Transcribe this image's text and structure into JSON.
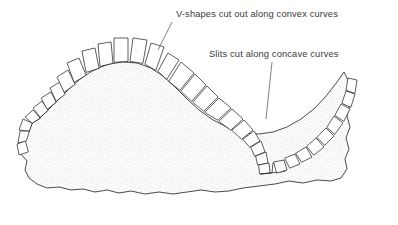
{
  "figure": {
    "background_color": "#ffffff",
    "outline_color": "#2b2b2b",
    "fill_color": "#efefef",
    "text_color": "#3a3a3a"
  },
  "annotations": [
    {
      "id": "convex-annotation",
      "label": "V-shapes cut out along convex curves",
      "text_x": 176,
      "text_y": 17,
      "leader_from_x": 172,
      "leader_from_y": 22,
      "leader_to_x": 158,
      "leader_to_y": 50
    },
    {
      "id": "concave-annotation",
      "label": "Slits cut along concave curves",
      "text_x": 209,
      "text_y": 57,
      "leader_from_x": 272,
      "leader_from_y": 62,
      "leader_to_x": 266,
      "leader_to_y": 119
    }
  ],
  "shape": {
    "name": "hide-body",
    "description": "Irregular leather hide with a convex dome at left and a concave valley at right",
    "outline_path": "M 19 146 L 22 139 L 28 132 L 31 124 L 38 120 L 46 112 L 54 104 L 62 96 L 72 86 L 83 77 L 95 70 L 108 65 L 122 63 L 136 64 L 150 69 L 162 77 L 174 88 L 186 100 L 198 111 L 212 121 L 228 129 L 244 134 L 258 135 L 272 133 L 286 128 L 300 120 L 314 109 L 326 96 L 336 83 L 343 73 L 347 80 L 346 92 L 349 104 L 346 116 L 349 127 L 345 138 L 348 149 L 344 159 L 346 169 L 340 178 L 330 181 L 316 180 L 302 183 L 288 181 L 274 184 L 258 186 L 242 188 L 228 191 L 214 192 L 200 190 L 186 192 L 172 194 L 158 192 L 144 194 L 130 191 L 118 193 L 106 190 L 94 192 L 82 189 L 70 190 L 58 187 L 46 188 L 36 184 L 28 178 L 24 170 L 26 161 L 21 154 Z",
    "convex_flap_count": 11,
    "concave_flap_count": 14
  },
  "flaps": {
    "convex_group_name": "v-shape-flaps",
    "concave_group_name": "slit-flaps",
    "convex_note": "Trapezoidal tabs separated by wedge-shaped V gaps along the convex dome",
    "concave_note": "Rectangular tabs separated by narrow slits along the concave valley"
  }
}
